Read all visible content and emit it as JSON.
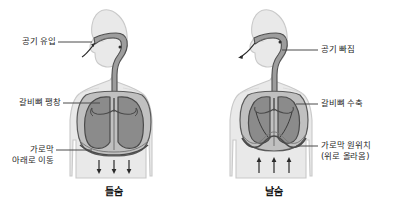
{
  "figure": {
    "title_alt": "들숨과 날숨의 호흡 운동 비교 그림",
    "background_color": "#ffffff",
    "body_fill": "#e9e9e9",
    "body_stroke": "#c4c4c4",
    "lung_fill": "#8b8b8b",
    "lung_stroke": "#4f4f4f",
    "cavity_fill": "#b9b9b9",
    "cavity_stroke": "#5a5a5a",
    "airway_fill": "#9a9a9a",
    "airway_stroke": "#4a4a4a",
    "arrow_color": "#2a2a2a",
    "leader_color": "#4a4a4a",
    "text_color": "#1f1f1f"
  },
  "panels": [
    {
      "id": "inhale",
      "caption": "들숨",
      "labels": [
        {
          "id": "air-in",
          "text": "공기 유입",
          "align": "right"
        },
        {
          "id": "rib-expand",
          "text": "갈비뼈 팽창",
          "align": "right"
        },
        {
          "id": "diaphragm-down",
          "text": "가로막\n아래로 이동",
          "align": "right"
        }
      ],
      "diaphragm_arrows": {
        "direction": "down",
        "count": 3
      },
      "nose_arrow": {
        "direction": "in"
      }
    },
    {
      "id": "exhale",
      "caption": "날숨",
      "labels": [
        {
          "id": "air-out",
          "text": "공기 빠짐",
          "align": "left"
        },
        {
          "id": "rib-contract",
          "text": "갈비뼈 수축",
          "align": "left"
        },
        {
          "id": "diaphragm-up",
          "text": "가로막 원위치\n(위로 올라옴)",
          "align": "left"
        }
      ],
      "diaphragm_arrows": {
        "direction": "up",
        "count": 3
      },
      "nose_arrow": {
        "direction": "out"
      }
    }
  ]
}
